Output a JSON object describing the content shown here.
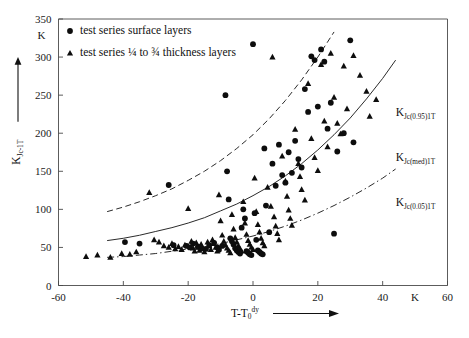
{
  "chart_data": {
    "type": "scatter",
    "title": "",
    "xlabel": "T-T0dy",
    "xlabel_main": "T-T",
    "xlabel_sub": "0",
    "xlabel_sup": "dy",
    "ylabel": "KJc-1T",
    "ylabel_main": "K",
    "ylabel_sub": "Jc-1T",
    "x_unit": "K",
    "y_unit": "K",
    "xlim": [
      -60,
      60
    ],
    "ylim": [
      0,
      350
    ],
    "xticks": [
      -60,
      -40,
      -20,
      0,
      20,
      40,
      60
    ],
    "xtick_labels": [
      "-60",
      "-40",
      "-20",
      "0",
      "20",
      "40",
      "60"
    ],
    "yticks": [
      0,
      50,
      100,
      150,
      200,
      250,
      300,
      350
    ],
    "ytick_labels": [
      "0",
      "50",
      "100",
      "150",
      "200",
      "250",
      "300",
      "350"
    ],
    "grid": false,
    "legend_position": "top-left-inside",
    "legend": [
      {
        "marker": "circle",
        "label": "test series surface layers"
      },
      {
        "marker": "triangle",
        "label": "test series ¼ to ¾ thickness layers"
      }
    ],
    "annotations": [
      {
        "text": "KJc(0.95)1T",
        "main": "K",
        "sub": "Jc(0.95)1T",
        "x": 44,
        "y": 222,
        "style": "dashed"
      },
      {
        "text": "KJc(med)1T",
        "main": "K",
        "sub": "Jc(med)1T",
        "x": 44,
        "y": 163,
        "style": "solid"
      },
      {
        "text": "KJc(0.05)1T",
        "main": "K",
        "sub": "Jc(0.05)1T",
        "x": 44,
        "y": 104,
        "style": "dashdot"
      }
    ],
    "series": [
      {
        "name": "test series surface layers",
        "marker": "circle",
        "points": [
          [
            -39.5,
            57
          ],
          [
            -35.0,
            55
          ],
          [
            -26.0,
            132
          ],
          [
            -24.5,
            53
          ],
          [
            -20.5,
            52
          ],
          [
            -19.5,
            50
          ],
          [
            -18.5,
            55
          ],
          [
            -17.0,
            51
          ],
          [
            -16.0,
            49
          ],
          [
            -14.5,
            48
          ],
          [
            -13.5,
            53
          ],
          [
            -12.0,
            56
          ],
          [
            -11.0,
            50
          ],
          [
            -10.5,
            47
          ],
          [
            -9.5,
            52
          ],
          [
            -8.5,
            250
          ],
          [
            -8.0,
            150
          ],
          [
            -7.5,
            113
          ],
          [
            -7.0,
            62
          ],
          [
            -6.5,
            58
          ],
          [
            -6.0,
            54
          ],
          [
            -5.5,
            49
          ],
          [
            -5.0,
            46
          ],
          [
            -4.5,
            44
          ],
          [
            -4.0,
            42
          ],
          [
            -3.5,
            76
          ],
          [
            -3.0,
            100
          ],
          [
            -2.5,
            88
          ],
          [
            -2.0,
            45
          ],
          [
            -1.5,
            43
          ],
          [
            -1.0,
            41
          ],
          [
            -0.5,
            40
          ],
          [
            0.0,
            317
          ],
          [
            0.5,
            95
          ],
          [
            1.0,
            60
          ],
          [
            1.5,
            46
          ],
          [
            2.0,
            44
          ],
          [
            2.5,
            42
          ],
          [
            3.0,
            41
          ],
          [
            3.5,
            180
          ],
          [
            4.0,
            105
          ],
          [
            5.0,
            70
          ],
          [
            6.0,
            160
          ],
          [
            7.0,
            131
          ],
          [
            8.0,
            185
          ],
          [
            9.0,
            145
          ],
          [
            10.0,
            135
          ],
          [
            11.0,
            175
          ],
          [
            12.0,
            148
          ],
          [
            13.0,
            190
          ],
          [
            14.0,
            166
          ],
          [
            15.0,
            155
          ],
          [
            16.0,
            258
          ],
          [
            17.0,
            228
          ],
          [
            18.0,
            301
          ],
          [
            19.0,
            296
          ],
          [
            20.0,
            235
          ],
          [
            21.0,
            310
          ],
          [
            22.0,
            294
          ],
          [
            23.0,
            206
          ],
          [
            24.0,
            240
          ],
          [
            25.0,
            68
          ],
          [
            26.0,
            176
          ],
          [
            28.0,
            200
          ],
          [
            30.0,
            322
          ],
          [
            31.0,
            188
          ]
        ]
      },
      {
        "name": "test series 1/4 to 3/4 thickness layers",
        "marker": "triangle",
        "points": [
          [
            -51.5,
            38
          ],
          [
            -48.0,
            40
          ],
          [
            -44.0,
            37
          ],
          [
            -40.5,
            42
          ],
          [
            -38.0,
            41
          ],
          [
            -36.0,
            44
          ],
          [
            -32.0,
            122
          ],
          [
            -30.5,
            60
          ],
          [
            -29.0,
            57
          ],
          [
            -27.5,
            52
          ],
          [
            -26.0,
            50
          ],
          [
            -25.0,
            55
          ],
          [
            -24.0,
            48
          ],
          [
            -23.0,
            51
          ],
          [
            -22.0,
            47
          ],
          [
            -21.0,
            53
          ],
          [
            -20.0,
            101
          ],
          [
            -19.0,
            58
          ],
          [
            -18.5,
            49
          ],
          [
            -18.0,
            45
          ],
          [
            -17.5,
            56
          ],
          [
            -17.0,
            50
          ],
          [
            -16.5,
            46
          ],
          [
            -16.0,
            54
          ],
          [
            -15.5,
            48
          ],
          [
            -15.0,
            44
          ],
          [
            -14.0,
            57
          ],
          [
            -13.5,
            52
          ],
          [
            -13.0,
            47
          ],
          [
            -12.5,
            60
          ],
          [
            -12.0,
            55
          ],
          [
            -11.5,
            50
          ],
          [
            -11.0,
            45
          ],
          [
            -10.5,
            119
          ],
          [
            -10.0,
            85
          ],
          [
            -9.5,
            66
          ],
          [
            -9.0,
            58
          ],
          [
            -8.5,
            53
          ],
          [
            -8.0,
            49
          ],
          [
            -7.5,
            46
          ],
          [
            -7.0,
            43
          ],
          [
            -6.5,
            93
          ],
          [
            -6.0,
            74
          ],
          [
            -5.5,
            63
          ],
          [
            -5.0,
            57
          ],
          [
            -4.5,
            52
          ],
          [
            -4.0,
            48
          ],
          [
            -3.5,
            45
          ],
          [
            -3.0,
            110
          ],
          [
            -2.5,
            82
          ],
          [
            -2.0,
            67
          ],
          [
            -1.5,
            59
          ],
          [
            -1.0,
            54
          ],
          [
            -0.5,
            50
          ],
          [
            0.0,
            47
          ],
          [
            0.5,
            141
          ],
          [
            1.0,
            97
          ],
          [
            1.5,
            80
          ],
          [
            2.0,
            70
          ],
          [
            2.5,
            62
          ],
          [
            3.0,
            56
          ],
          [
            3.5,
            52
          ],
          [
            4.5,
            129
          ],
          [
            5.5,
            104
          ],
          [
            6.0,
            300
          ],
          [
            6.5,
            90
          ],
          [
            7.0,
            78
          ],
          [
            7.5,
            68
          ],
          [
            8.0,
            60
          ],
          [
            9.0,
            170
          ],
          [
            10.0,
            137
          ],
          [
            10.5,
            117
          ],
          [
            11.0,
            99
          ],
          [
            11.5,
            88
          ],
          [
            12.0,
            79
          ],
          [
            13.0,
            205
          ],
          [
            14.0,
            160
          ],
          [
            14.5,
            143
          ],
          [
            15.0,
            126
          ],
          [
            16.0,
            112
          ],
          [
            17.0,
            265
          ],
          [
            18.0,
            193
          ],
          [
            19.0,
            168
          ],
          [
            20.0,
            151
          ],
          [
            21.0,
            290
          ],
          [
            22.0,
            216
          ],
          [
            23.0,
            182
          ],
          [
            24.0,
            305
          ],
          [
            25.0,
            247
          ],
          [
            26.0,
            213
          ],
          [
            27.0,
            199
          ],
          [
            28.0,
            288
          ],
          [
            29.0,
            232
          ],
          [
            31.0,
            302
          ],
          [
            33.0,
            276
          ],
          [
            35.0,
            255
          ],
          [
            36.0,
            222
          ],
          [
            38.0,
            244
          ]
        ]
      }
    ],
    "curves": [
      {
        "name": "KJc(0.95)1T",
        "style": "dashed",
        "points": [
          [
            -45,
            97
          ],
          [
            -40,
            103
          ],
          [
            -35,
            110
          ],
          [
            -30,
            118
          ],
          [
            -25,
            127
          ],
          [
            -20,
            138
          ],
          [
            -15,
            150
          ],
          [
            -10,
            164
          ],
          [
            -5,
            180
          ],
          [
            0,
            198
          ],
          [
            5,
            219
          ],
          [
            10,
            243
          ],
          [
            15,
            270
          ],
          [
            20,
            300
          ],
          [
            25,
            333
          ]
        ]
      },
      {
        "name": "KJc(med)1T",
        "style": "solid",
        "points": [
          [
            -45,
            59
          ],
          [
            -40,
            62
          ],
          [
            -35,
            66
          ],
          [
            -30,
            71
          ],
          [
            -25,
            76
          ],
          [
            -20,
            82
          ],
          [
            -15,
            89
          ],
          [
            -10,
            98
          ],
          [
            -5,
            107
          ],
          [
            0,
            118
          ],
          [
            5,
            130
          ],
          [
            10,
            144
          ],
          [
            15,
            160
          ],
          [
            20,
            178
          ],
          [
            25,
            198
          ],
          [
            30,
            220
          ],
          [
            35,
            245
          ],
          [
            40,
            272
          ],
          [
            44,
            296
          ]
        ]
      },
      {
        "name": "KJc(0.05)1T",
        "style": "dashdot",
        "points": [
          [
            -45,
            37
          ],
          [
            -40,
            38
          ],
          [
            -35,
            40
          ],
          [
            -30,
            42
          ],
          [
            -25,
            45
          ],
          [
            -20,
            48
          ],
          [
            -15,
            51
          ],
          [
            -10,
            55
          ],
          [
            -5,
            60
          ],
          [
            0,
            65
          ],
          [
            5,
            71
          ],
          [
            10,
            78
          ],
          [
            15,
            86
          ],
          [
            20,
            95
          ],
          [
            25,
            105
          ],
          [
            30,
            116
          ],
          [
            35,
            128
          ],
          [
            40,
            141
          ],
          [
            44,
            153
          ]
        ]
      }
    ]
  }
}
